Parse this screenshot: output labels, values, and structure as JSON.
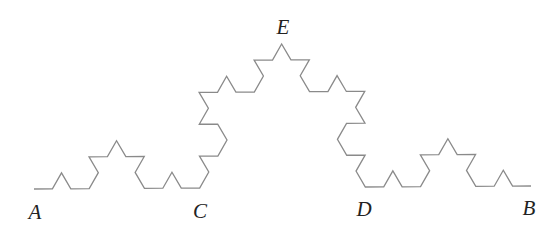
{
  "diagram": {
    "type": "koch-curve",
    "iterations": 3,
    "stroke_color": "#8a8a8a",
    "stroke_width": 1.3,
    "start": {
      "x": 34,
      "y": 189
    },
    "end": {
      "x": 531,
      "y": 186
    },
    "labels": [
      {
        "id": "A",
        "text": "A",
        "x": 35,
        "y": 212
      },
      {
        "id": "C",
        "text": "C",
        "x": 200,
        "y": 211
      },
      {
        "id": "E",
        "text": "E",
        "x": 283,
        "y": 27
      },
      {
        "id": "D",
        "text": "D",
        "x": 364,
        "y": 209
      },
      {
        "id": "B",
        "text": "B",
        "x": 529,
        "y": 208
      }
    ]
  }
}
